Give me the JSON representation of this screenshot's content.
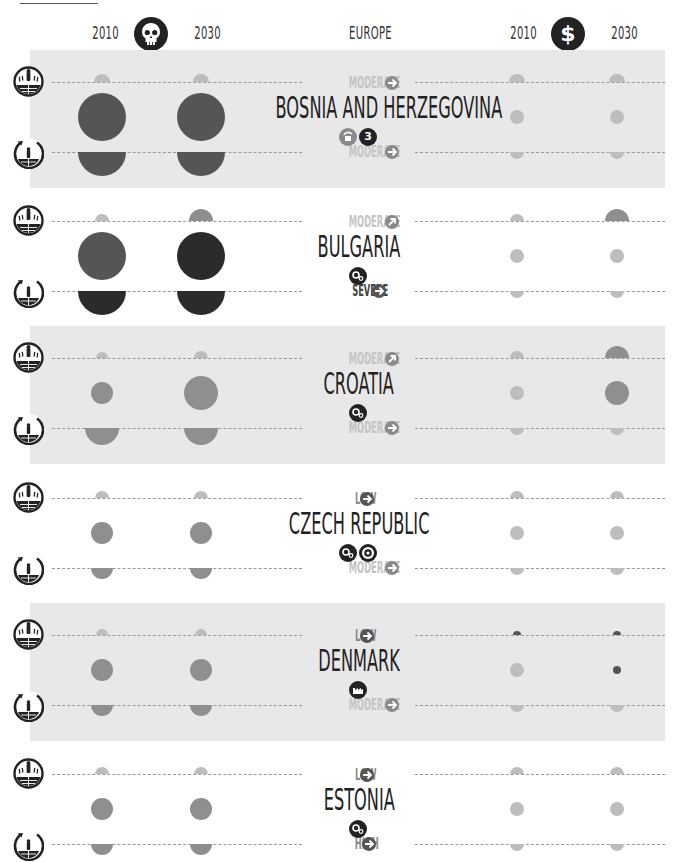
{
  "header": {
    "region": "EUROPE",
    "left_group": {
      "icon": "skull-icon",
      "year_start": "2010",
      "year_end": "2030"
    },
    "right_group": {
      "icon": "dollar-icon",
      "year_start": "2010",
      "year_end": "2030"
    }
  },
  "row_icons": {
    "top": "person-globe-heat-icon",
    "bottom": "globe-rotation-icon"
  },
  "colors": {
    "band": "#e8e8e8",
    "very_dark": "#2b2b2b",
    "dark": "#555555",
    "mid": "#8f8f8f",
    "light": "#bdbdbd",
    "level_light": "#c4c4c4",
    "level_dark": "#444444"
  },
  "countries": [
    {
      "name": "BOSNIA AND HERZEGOVINA",
      "shaded": true,
      "top_level": {
        "label": "MODERATE",
        "arrow": "right",
        "tone": "light"
      },
      "bottom_level": {
        "label": "MODERATE",
        "arrow": "right",
        "tone": "light"
      },
      "badges": [
        {
          "icon": "hand-cup-icon",
          "tone": "mid"
        },
        {
          "icon": "number-3-icon",
          "text": "3",
          "tone": "dark"
        }
      ]
    },
    {
      "name": "BULGARIA",
      "shaded": false,
      "top_level": {
        "label": "MODERATE",
        "arrow": "up-right",
        "tone": "light"
      },
      "bottom_level": {
        "label": "SEVERE",
        "arrow": "right",
        "tone": "dark"
      },
      "badges": [
        {
          "icon": "gears-icon",
          "tone": "dark"
        }
      ]
    },
    {
      "name": "CROATIA",
      "shaded": true,
      "top_level": {
        "label": "MODERATE",
        "arrow": "up-right",
        "tone": "light"
      },
      "bottom_level": {
        "label": "MODERATE",
        "arrow": "right",
        "tone": "light"
      },
      "badges": [
        {
          "icon": "gears-icon",
          "tone": "dark"
        }
      ]
    },
    {
      "name": "CZECH REPUBLIC",
      "shaded": false,
      "top_level": {
        "label": "LOW",
        "arrow": "right",
        "tone": "mid"
      },
      "bottom_level": {
        "label": "MODERATE",
        "arrow": "right",
        "tone": "light"
      },
      "badges": [
        {
          "icon": "gears-icon",
          "tone": "dark"
        },
        {
          "icon": "target-icon",
          "tone": "dark"
        }
      ]
    },
    {
      "name": "DENMARK",
      "shaded": true,
      "top_level": {
        "label": "LOW",
        "arrow": "right",
        "tone": "mid"
      },
      "bottom_level": {
        "label": "MODERATE",
        "arrow": "right",
        "tone": "light"
      },
      "badges": [
        {
          "icon": "factory-icon",
          "tone": "dark"
        }
      ]
    },
    {
      "name": "ESTONIA",
      "shaded": false,
      "top_level": {
        "label": "LOW",
        "arrow": "right",
        "tone": "mid"
      },
      "bottom_level": {
        "label": "HIGH",
        "arrow": "right",
        "tone": "mid"
      },
      "badges": [
        {
          "icon": "gears-icon",
          "tone": "dark"
        }
      ]
    }
  ],
  "chart_data": {
    "type": "bubble-matrix",
    "title": "EUROPE",
    "column_groups": [
      {
        "icon": "skull-icon",
        "meaning": "mortality impact",
        "columns": [
          "2010",
          "2030"
        ]
      },
      {
        "icon": "dollar-icon",
        "meaning": "economic impact",
        "columns": [
          "2010",
          "2030"
        ]
      }
    ],
    "legend_note": "Circle size = relative magnitude; darker = more severe. Each country has a top half-circle row, a middle full circle row and a bottom half-circle row.",
    "rows": [
      {
        "country": "BOSNIA AND HERZEGOVINA",
        "skull": {
          "top": [
            [
              8,
              "light"
            ],
            [
              8,
              "light"
            ]
          ],
          "mid": [
            [
              24,
              "dark"
            ],
            [
              24,
              "dark"
            ]
          ],
          "bottom": [
            [
              24,
              "dark"
            ],
            [
              24,
              "dark"
            ]
          ]
        },
        "dollar": {
          "top": [
            [
              8,
              "light"
            ],
            [
              8,
              "light"
            ]
          ],
          "mid": [
            [
              7,
              "light"
            ],
            [
              7,
              "light"
            ]
          ],
          "bottom": [
            [
              7,
              "light"
            ],
            [
              7,
              "light"
            ]
          ]
        }
      },
      {
        "country": "BULGARIA",
        "skull": {
          "top": [
            [
              7,
              "light"
            ],
            [
              12,
              "mid"
            ]
          ],
          "mid": [
            [
              24,
              "dark"
            ],
            [
              24,
              "very_dark"
            ]
          ],
          "bottom": [
            [
              24,
              "very_dark"
            ],
            [
              24,
              "very_dark"
            ]
          ]
        },
        "dollar": {
          "top": [
            [
              7,
              "light"
            ],
            [
              12,
              "mid"
            ]
          ],
          "mid": [
            [
              7,
              "light"
            ],
            [
              7,
              "light"
            ]
          ],
          "bottom": [
            [
              7,
              "light"
            ],
            [
              7,
              "light"
            ]
          ]
        }
      },
      {
        "country": "CROATIA",
        "skull": {
          "top": [
            [
              6,
              "light"
            ],
            [
              7,
              "light"
            ]
          ],
          "mid": [
            [
              11,
              "mid"
            ],
            [
              17,
              "mid"
            ]
          ],
          "bottom": [
            [
              17,
              "mid"
            ],
            [
              17,
              "mid"
            ]
          ]
        },
        "dollar": {
          "top": [
            [
              7,
              "light"
            ],
            [
              12,
              "mid"
            ]
          ],
          "mid": [
            [
              7,
              "light"
            ],
            [
              12,
              "mid"
            ]
          ],
          "bottom": [
            [
              7,
              "light"
            ],
            [
              7,
              "light"
            ]
          ]
        }
      },
      {
        "country": "CZECH REPUBLIC",
        "skull": {
          "top": [
            [
              7,
              "light"
            ],
            [
              7,
              "light"
            ]
          ],
          "mid": [
            [
              11,
              "mid"
            ],
            [
              11,
              "mid"
            ]
          ],
          "bottom": [
            [
              11,
              "mid"
            ],
            [
              11,
              "mid"
            ]
          ]
        },
        "dollar": {
          "top": [
            [
              7,
              "light"
            ],
            [
              7,
              "light"
            ]
          ],
          "mid": [
            [
              7,
              "light"
            ],
            [
              7,
              "light"
            ]
          ],
          "bottom": [
            [
              7,
              "light"
            ],
            [
              7,
              "light"
            ]
          ]
        }
      },
      {
        "country": "DENMARK",
        "skull": {
          "top": [
            [
              6,
              "light"
            ],
            [
              6,
              "light"
            ]
          ],
          "mid": [
            [
              11,
              "mid"
            ],
            [
              11,
              "mid"
            ]
          ],
          "bottom": [
            [
              11,
              "mid"
            ],
            [
              11,
              "mid"
            ]
          ]
        },
        "dollar": {
          "top": [
            [
              4,
              "dark"
            ],
            [
              4,
              "dark"
            ]
          ],
          "mid": [
            [
              7,
              "light"
            ],
            [
              4,
              "dark"
            ]
          ],
          "bottom": [
            [
              7,
              "light"
            ],
            [
              7,
              "light"
            ]
          ]
        }
      },
      {
        "country": "ESTONIA",
        "skull": {
          "top": [
            [
              7,
              "light"
            ],
            [
              7,
              "light"
            ]
          ],
          "mid": [
            [
              11,
              "mid"
            ],
            [
              11,
              "mid"
            ]
          ],
          "bottom": [
            [
              11,
              "mid"
            ],
            [
              11,
              "mid"
            ]
          ]
        },
        "dollar": {
          "top": [
            [
              7,
              "light"
            ],
            [
              7,
              "light"
            ]
          ],
          "mid": [
            [
              7,
              "light"
            ],
            [
              7,
              "light"
            ]
          ],
          "bottom": [
            [
              7,
              "light"
            ],
            [
              7,
              "light"
            ]
          ]
        }
      }
    ]
  }
}
